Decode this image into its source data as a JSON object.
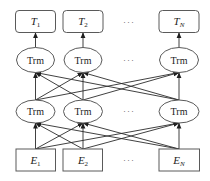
{
  "diagram": {
    "output_tokens": [
      {
        "base": "T",
        "sub": "1"
      },
      {
        "base": "T",
        "sub": "2"
      },
      {
        "base": "T",
        "sub": "N"
      }
    ],
    "upper_layer": [
      "Trm",
      "Trm",
      "Trm"
    ],
    "lower_layer": [
      "Trm",
      "Trm",
      "Trm"
    ],
    "input_embeddings": [
      {
        "base": "E",
        "sub": "1"
      },
      {
        "base": "E",
        "sub": "2"
      },
      {
        "base": "E",
        "sub": "N"
      }
    ],
    "ellipsis": "···"
  },
  "colors": {
    "arrow": "#2b2b2b",
    "border": "#5a5a5a",
    "background": "#ffffff"
  }
}
